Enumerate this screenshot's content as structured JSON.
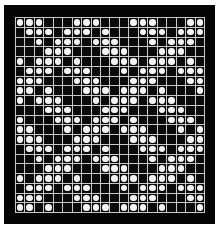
{
  "board": {
    "rows": 20,
    "cols": 20,
    "colors": {
      "background": "#ffffff",
      "frame": "#050505",
      "cell": "#0a0a0a",
      "grid_line": "#c8c8c8",
      "piece": "#f4f4f4"
    },
    "pieces_by_row": [
      [
        0,
        1,
        2,
        6,
        7,
        8,
        12,
        13,
        14,
        18,
        19
      ],
      [
        1,
        2,
        3,
        5,
        6,
        7,
        9,
        13,
        14,
        15,
        17,
        18,
        19
      ],
      [
        2,
        4,
        5,
        6,
        8,
        9,
        10,
        14,
        16,
        17,
        18
      ],
      [
        3,
        4,
        5,
        9,
        10,
        11,
        15,
        16,
        17
      ],
      [
        0,
        2,
        3,
        4,
        6,
        10,
        11,
        12,
        14,
        15,
        16,
        18
      ],
      [
        1,
        2,
        3,
        5,
        6,
        7,
        11,
        13,
        14,
        15,
        17,
        18,
        19
      ],
      [
        0,
        1,
        2,
        6,
        7,
        8,
        12,
        13,
        14,
        18,
        19
      ],
      [
        0,
        1,
        3,
        7,
        8,
        9,
        11,
        12,
        13,
        15,
        19
      ],
      [
        0,
        2,
        3,
        4,
        8,
        10,
        11,
        12,
        14,
        15,
        16
      ],
      [
        3,
        4,
        5,
        9,
        10,
        11,
        15,
        16,
        17
      ],
      [
        0,
        4,
        5,
        6,
        8,
        9,
        10,
        12,
        16,
        17,
        18
      ],
      [
        0,
        1,
        5,
        7,
        8,
        9,
        11,
        12,
        13,
        17,
        19
      ],
      [
        0,
        1,
        2,
        6,
        7,
        8,
        12,
        13,
        14,
        18,
        19
      ],
      [
        1,
        2,
        3,
        5,
        6,
        7,
        9,
        13,
        14,
        15,
        17,
        18,
        19
      ],
      [
        2,
        4,
        5,
        6,
        8,
        9,
        10,
        14,
        16,
        17,
        18
      ],
      [
        3,
        4,
        5,
        9,
        10,
        11,
        15,
        16,
        17
      ],
      [
        0,
        2,
        3,
        4,
        6,
        10,
        11,
        12,
        14,
        15,
        16,
        18
      ],
      [
        1,
        2,
        3,
        5,
        6,
        7,
        11,
        13,
        14,
        15,
        17,
        18,
        19
      ],
      [
        0,
        1,
        2,
        6,
        7,
        8,
        12,
        13,
        14,
        18,
        19
      ],
      [
        0,
        1,
        3,
        7,
        8,
        9,
        11,
        12,
        13,
        15,
        19
      ]
    ]
  }
}
